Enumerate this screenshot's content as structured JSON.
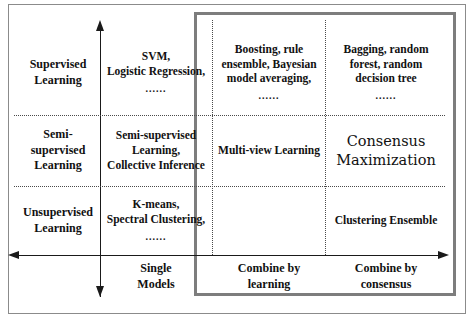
{
  "figure": {
    "colors": {
      "highlight_box_border": "#7d7d7d",
      "outer_frame": "#8b8b8b",
      "axis": "#1a1a1a",
      "grid_dotted": "#4a4a4a",
      "text": "#111111",
      "background": "#ffffff"
    }
  },
  "axes": {
    "vertical": {
      "name": "learning-supervision-axis",
      "arrowheads": "both",
      "categories": [
        "Supervised Learning",
        "Semi-supervised Learning",
        "Unsupervised Learning"
      ]
    },
    "horizontal": {
      "name": "combination-strategy-axis",
      "arrowheads": "both",
      "categories": [
        "Single Models",
        "Combine by learning",
        "Combine by consensus"
      ]
    }
  },
  "row_labels": [
    "Supervised\nLearning",
    "Semi-\nsupervised\nLearning",
    "Unsupervised\nLearning"
  ],
  "rows": {
    "supervised": {
      "label_line1": "Supervised",
      "label_line2": "Learning"
    },
    "semi_supervised": {
      "label_line1": "Semi-",
      "label_line2": "supervised",
      "label_line3": "Learning"
    },
    "unsupervised": {
      "label_line1": "Unsupervised",
      "label_line2": "Learning"
    }
  },
  "column_labels": {
    "single_models_line1": "Single",
    "single_models_line2": "Models",
    "combine_learning_line1": "Combine by",
    "combine_learning_line2": "learning",
    "combine_consensus_line1": "Combine by",
    "combine_consensus_line2": "consensus"
  },
  "cells": {
    "supervised_single": {
      "line1": "SVM,",
      "line2": "Logistic Regression,",
      "ellipsis": "......"
    },
    "supervised_learning_combo": {
      "line1": "Boosting, rule",
      "line2": "ensemble, Bayesian",
      "line3": "model averaging,",
      "ellipsis": "......"
    },
    "supervised_consensus_combo": {
      "line1": "Bagging, random",
      "line2": "forest, random",
      "line3": "decision tree",
      "ellipsis": "......"
    },
    "semi_single": {
      "line1": "Semi-supervised",
      "line2": "Learning,",
      "line3": "Collective Inference"
    },
    "semi_learning_combo": {
      "line1": "Multi-view Learning"
    },
    "semi_consensus_combo": {
      "line1": "Consensus",
      "line2": "Maximization"
    },
    "unsupervised_single": {
      "line1": "K-means,",
      "line2": "Spectral Clustering,",
      "ellipsis": "......"
    },
    "unsupervised_learning_combo": {
      "line1": ""
    },
    "unsupervised_consensus_combo": {
      "line1": "Clustering Ensemble"
    }
  }
}
